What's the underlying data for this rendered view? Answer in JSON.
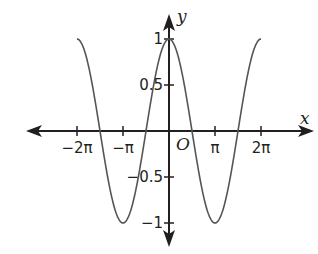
{
  "chart_data": {
    "type": "line",
    "title": "",
    "function": "y = cos(x)",
    "xlabel": "x",
    "ylabel": "y",
    "origin_label": "O",
    "xlim": [
      -2.75,
      3.3
    ],
    "ylim": [
      -1.25,
      1.17
    ],
    "x_unit": "pi",
    "x_ticks": [
      {
        "value": -2,
        "label": "−2π"
      },
      {
        "value": -1,
        "label": "−π"
      },
      {
        "value": 1,
        "label": "π"
      },
      {
        "value": 2,
        "label": "2π"
      }
    ],
    "y_ticks": [
      {
        "value": 1,
        "label": "1"
      },
      {
        "value": 0.5,
        "label": "0.5"
      },
      {
        "value": -0.5,
        "label": "−0.5"
      },
      {
        "value": -1,
        "label": "−1"
      }
    ],
    "series": [
      {
        "name": "y = cos x",
        "x_range": [
          -6.2832,
          6.2832
        ],
        "x": [
          -6.2832,
          -4.7124,
          -3.1416,
          -1.5708,
          0,
          1.5708,
          3.1416,
          4.7124,
          6.2832
        ],
        "values": [
          1,
          0,
          -1,
          0,
          1,
          0,
          -1,
          0,
          1
        ],
        "color": "#555555"
      }
    ],
    "grid": false,
    "legend": null,
    "axis_color": "#231f20"
  }
}
